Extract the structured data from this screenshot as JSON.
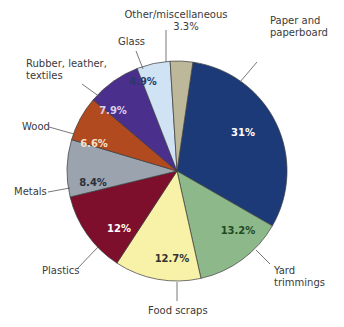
{
  "chart_data": {
    "type": "pie",
    "title": "",
    "start_angle_deg": 8.3,
    "direction": "clockwise",
    "center": [
      177,
      171
    ],
    "radius": 110,
    "slices": [
      {
        "name": "Paper and paperboard",
        "label_lines": [
          "Paper and",
          "paperboard"
        ],
        "value": 31,
        "pct_label": "31%",
        "color": "#1c3a78",
        "text_color": "#ffffff",
        "label_pos": [
          270,
          24
        ],
        "leader": [
          [
            257,
            62
          ],
          [
            240,
            82
          ]
        ],
        "pct_pos": [
          243,
          136
        ]
      },
      {
        "name": "Yard trimmings",
        "label_lines": [
          "Yard",
          "trimmings"
        ],
        "value": 13.2,
        "pct_label": "13.2%",
        "color": "#8cb88a",
        "text_color": "#1f4a22",
        "label_pos": [
          274,
          274
        ],
        "leader": [
          [
            270,
            264
          ],
          [
            256,
            250
          ]
        ],
        "pct_pos": [
          238,
          234
        ]
      },
      {
        "name": "Food scraps",
        "label_lines": [
          "Food scraps"
        ],
        "value": 12.7,
        "pct_label": "12.7%",
        "color": "#f7f2a8",
        "text_color": "#333333",
        "label_pos": [
          148,
          314
        ],
        "leader": [
          [
            177,
            301
          ],
          [
            177,
            282
          ]
        ],
        "pct_pos": [
          172,
          262
        ]
      },
      {
        "name": "Plastics",
        "label_lines": [
          "Plastics"
        ],
        "value": 12,
        "pct_label": "12%",
        "color": "#7e0f2c",
        "text_color": "#ffffff",
        "label_pos": [
          42,
          274
        ],
        "leader": [
          [
            77,
            269
          ],
          [
            98,
            247
          ]
        ],
        "pct_pos": [
          119,
          232
        ]
      },
      {
        "name": "Metals",
        "label_lines": [
          "Metals"
        ],
        "value": 8.4,
        "pct_label": "8.4%",
        "color": "#9aa3ae",
        "text_color": "#2a2f3a",
        "label_pos": [
          14,
          195
        ],
        "leader": [
          [
            48,
            192
          ],
          [
            70,
            188
          ]
        ],
        "pct_pos": [
          93,
          186
        ]
      },
      {
        "name": "Wood",
        "label_lines": [
          "Wood"
        ],
        "value": 6.6,
        "pct_label": "6.6%",
        "color": "#b24a1f",
        "text_color": "#f7e0c8",
        "label_pos": [
          22,
          130
        ],
        "leader": [
          [
            49,
            127
          ],
          [
            74,
            134
          ]
        ],
        "pct_pos": [
          94,
          147
        ]
      },
      {
        "name": "Rubber, leather, textiles",
        "label_lines": [
          "Rubber, leather,",
          "textiles"
        ],
        "value": 7.9,
        "pct_label": "7.9%",
        "color": "#4a2f8c",
        "text_color": "#d8cff0",
        "label_pos": [
          26,
          67
        ],
        "leader": [
          [
            82,
            84
          ],
          [
            100,
            97
          ]
        ],
        "pct_pos": [
          113,
          114
        ]
      },
      {
        "name": "Glass",
        "label_lines": [
          "Glass"
        ],
        "value": 4.9,
        "pct_label": "4.9%",
        "color": "#cfe3f5",
        "text_color": "#2a3a66",
        "label_pos": [
          118,
          45
        ],
        "leader": [
          [
            136,
            51
          ],
          [
            143,
            69
          ]
        ],
        "pct_pos": [
          143,
          85
        ]
      },
      {
        "name": "Other/miscellaneous",
        "label_lines": [
          "Other/miscellaneous",
          "3.3%"
        ],
        "value": 3.3,
        "pct_label": "",
        "color": "#bdb89a",
        "text_color": "#333333",
        "label_pos": [
          176,
          18
        ],
        "leader": [
          [
            166,
            30
          ],
          [
            166,
            62
          ]
        ],
        "pct_pos": null
      }
    ],
    "legend": "none (direct labels with leader lines)",
    "edge_color": "#3a3a3a"
  }
}
